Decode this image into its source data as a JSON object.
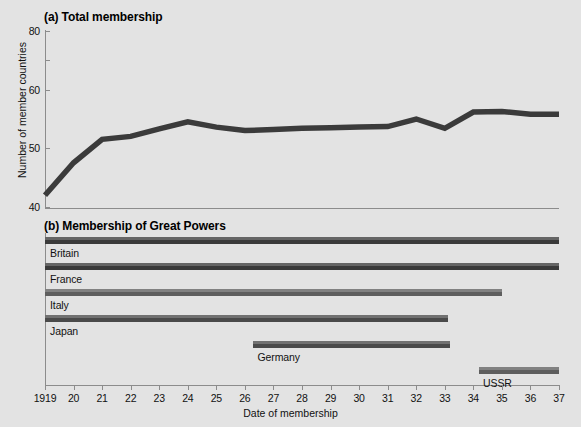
{
  "figure": {
    "background": "#e3e3e3",
    "axis_color": "#8c8c8c",
    "line_color": "#3b3b3b"
  },
  "panel_a": {
    "title": "(a) Total membership",
    "ylabel": "Number of member countries"
  },
  "panel_b": {
    "title": "(b) Membership of Great Powers",
    "xlabel": "Date of membership"
  },
  "chart_data": [
    {
      "type": "line",
      "title": "(a) Total membership",
      "xlabel": "",
      "ylabel": "Number of member countries",
      "ylim": [
        40,
        80
      ],
      "xlim": [
        1919,
        1937
      ],
      "grid": false,
      "legend": "none",
      "ytick_labels": [
        "40",
        "50",
        "60",
        "80"
      ],
      "ytick_values": [
        40,
        50,
        60,
        80
      ],
      "ytick_pixel_y": [
        207,
        148,
        90,
        31
      ],
      "x": [
        1919,
        1920,
        1921,
        1922,
        1923,
        1924,
        1925,
        1926,
        1927,
        1928,
        1929,
        1930,
        1931,
        1932,
        1933,
        1934,
        1935,
        1936,
        1937
      ],
      "values": [
        42.0,
        47.5,
        51.5,
        52.0,
        53.3,
        54.5,
        53.6,
        53.0,
        53.2,
        53.4,
        53.5,
        53.6,
        53.7,
        55.0,
        53.4,
        56.2,
        56.3,
        55.8,
        55.8
      ],
      "series": [
        {
          "name": "Total membership",
          "color": "#3b3b3b",
          "values": [
            42.0,
            47.5,
            51.5,
            52.0,
            53.3,
            54.5,
            53.6,
            53.0,
            53.2,
            53.4,
            53.5,
            53.6,
            53.7,
            55.0,
            53.4,
            56.2,
            56.3,
            55.8,
            55.8
          ]
        }
      ]
    },
    {
      "type": "bar",
      "orientation": "horizontal",
      "title": "(b) Membership of Great Powers",
      "xlabel": "Date of membership",
      "ylabel": "",
      "xlim": [
        1919,
        1937
      ],
      "grid": false,
      "legend": "none",
      "categories": [
        "Britain",
        "France",
        "Italy",
        "Japan",
        "Germany",
        "USSR"
      ],
      "xtick_labels": [
        "1919",
        "20",
        "21",
        "22",
        "23",
        "24",
        "25",
        "26",
        "27",
        "28",
        "29",
        "30",
        "31",
        "32",
        "33",
        "34",
        "35",
        "36",
        "37"
      ],
      "xtick_values": [
        1919,
        1920,
        1921,
        1922,
        1923,
        1924,
        1925,
        1926,
        1927,
        1928,
        1929,
        1930,
        1931,
        1932,
        1933,
        1934,
        1935,
        1936,
        1937
      ],
      "bars": [
        {
          "name": "Britain",
          "start": 1919.0,
          "end": 1937.0,
          "color": "#3a3a3a",
          "label": "Britain"
        },
        {
          "name": "France",
          "start": 1919.0,
          "end": 1937.0,
          "color": "#3a3a3a",
          "label": "France"
        },
        {
          "name": "Italy",
          "start": 1919.0,
          "end": 1935.0,
          "color": "#5e5e5e",
          "label": "Italy"
        },
        {
          "name": "Japan",
          "start": 1919.0,
          "end": 1933.1,
          "color": "#4a4a4a",
          "label": "Japan"
        },
        {
          "name": "Germany",
          "start": 1926.3,
          "end": 1933.2,
          "color": "#4a4a4a",
          "label": "Germany"
        },
        {
          "name": "USSR",
          "start": 1934.2,
          "end": 1937.0,
          "color": "#5e5e5e",
          "label": "USSR"
        }
      ]
    }
  ]
}
